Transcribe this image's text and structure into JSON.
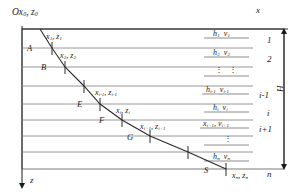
{
  "figure": {
    "type": "layered-medium ray-path diagram",
    "axes": {
      "x_label": "x",
      "z_label": "z",
      "depth_bracket_label": "H"
    },
    "origin_label": {
      "text": "Ox",
      "sub1": "0",
      "text2": ", z",
      "sub2": "0"
    }
  },
  "interfaces": [
    {
      "y": 29
    },
    {
      "y": 48
    },
    {
      "y": 67
    },
    {
      "y": 86
    },
    {
      "y": 104
    },
    {
      "y": 120
    },
    {
      "y": 136
    },
    {
      "y": 152
    },
    {
      "y": 169
    }
  ],
  "ray_points": [
    {
      "name": "P0",
      "x": 40,
      "y": 29
    },
    {
      "name": "A",
      "x": 52,
      "y": 48
    },
    {
      "name": "B",
      "x": 65,
      "y": 67
    },
    {
      "name": "C",
      "x": 84,
      "y": 86
    },
    {
      "name": "E",
      "x": 100,
      "y": 104
    },
    {
      "name": "F",
      "x": 122,
      "y": 120
    },
    {
      "name": "G",
      "x": 150,
      "y": 136
    },
    {
      "name": "R",
      "x": 188,
      "y": 152
    },
    {
      "name": "S",
      "x": 226,
      "y": 169
    }
  ],
  "point_labels": [
    {
      "id": "A",
      "text": "A",
      "x": 27,
      "y": 44
    },
    {
      "id": "B",
      "text": "B",
      "x": 41,
      "y": 63
    },
    {
      "id": "E",
      "text": "E",
      "x": 77,
      "y": 100
    },
    {
      "id": "F",
      "text": "F",
      "x": 99,
      "y": 116
    },
    {
      "id": "G",
      "text": "G",
      "x": 127,
      "y": 133
    },
    {
      "id": "S",
      "text": "S",
      "x": 204,
      "y": 166
    }
  ],
  "coordinate_labels": [
    {
      "id": "c1",
      "x_sym": "x",
      "x_sub": "1",
      "z_sym": "z",
      "z_sub": "1",
      "x": 46,
      "y": 33
    },
    {
      "id": "c2",
      "x_sym": "x",
      "x_sub": "2",
      "z_sym": "z",
      "z_sub": "2",
      "x": 60,
      "y": 52
    },
    {
      "id": "ci1",
      "x_sym": "x",
      "x_sub": "i-1",
      "z_sym": "z",
      "z_sub": "i-1",
      "x": 95,
      "y": 89
    },
    {
      "id": "ci",
      "x_sym": "x",
      "x_sub": "i",
      "z_sym": "z",
      "z_sub": "i",
      "x": 116,
      "y": 107
    },
    {
      "id": "ci2",
      "x_sym": "x",
      "x_sub": "i+1",
      "z_sym": "z",
      "z_sub": "i+1",
      "x": 140,
      "y": 123
    },
    {
      "id": "cn",
      "x_sym": "x",
      "x_sub": "n",
      "z_sym": "z",
      "z_sub": "n",
      "x": 219,
      "y": 172
    }
  ],
  "layer_properties": [
    {
      "id": "l1",
      "h_sym": "h",
      "h_sub": "1",
      "v_sym": "v",
      "v_sub": "1",
      "x": 213,
      "y": 33,
      "dots": false
    },
    {
      "id": "l2",
      "h_sym": "h",
      "h_sub": "2",
      "v_sym": "v",
      "v_sub": "2",
      "x": 213,
      "y": 52,
      "dots": false
    },
    {
      "id": "ld1",
      "h_sym": "",
      "h_sub": "",
      "v_sym": "",
      "v_sub": "",
      "x": 213,
      "y": 70,
      "dots": true
    },
    {
      "id": "li1",
      "h_sym": "h",
      "h_sub": "i-1",
      "v_sym": "v",
      "v_sub": "i-1",
      "x": 209,
      "y": 89,
      "dots": false
    },
    {
      "id": "li",
      "h_sym": "h",
      "h_sub": "i",
      "v_sym": "v",
      "v_sub": "i",
      "x": 213,
      "y": 107,
      "dots": false
    },
    {
      "id": "li2",
      "h_sym": "x",
      "h_sub": "i+1",
      "v_sym": "v",
      "v_sub": "i+1",
      "x": 207,
      "y": 123,
      "dots": false
    },
    {
      "id": "ld2",
      "h_sym": "",
      "h_sub": "",
      "v_sym": "",
      "v_sub": "",
      "x": 213,
      "y": 139,
      "dots": true
    },
    {
      "id": "ln",
      "h_sym": "h",
      "h_sub": "n",
      "v_sym": "v",
      "v_sub": "n",
      "x": 213,
      "y": 156,
      "dots": false
    }
  ],
  "layer_numbers": [
    {
      "id": "n1",
      "text": "1",
      "x": 267,
      "y": 38
    },
    {
      "id": "n2",
      "text": "2",
      "x": 267,
      "y": 57
    },
    {
      "id": "ni1",
      "text": "i-1",
      "x": 262,
      "y": 94
    },
    {
      "id": "ni",
      "text": "i",
      "x": 268,
      "y": 112
    },
    {
      "id": "ni2",
      "text": "i+1",
      "x": 262,
      "y": 128
    },
    {
      "id": "nn",
      "text": "n",
      "x": 267,
      "y": 172
    }
  ]
}
